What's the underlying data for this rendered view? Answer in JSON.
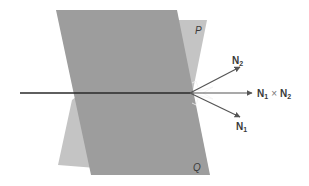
{
  "diagram": {
    "type": "intersecting-planes-normal-vectors",
    "planes": [
      {
        "name": "P",
        "label": "P",
        "color": "#c4c4c4"
      },
      {
        "name": "Q",
        "label": "Q",
        "color": "#9d9d9d"
      }
    ],
    "vectors": [
      {
        "name": "N2",
        "base": "N",
        "sub": "2"
      },
      {
        "name": "N1",
        "base": "N",
        "sub": "1"
      },
      {
        "name": "cross",
        "left": {
          "base": "N",
          "sub": "1"
        },
        "op": "×",
        "right": {
          "base": "N",
          "sub": "2"
        }
      }
    ],
    "colors": {
      "line": "#2a2a2a",
      "arrow": "#555555",
      "background": "#ffffff"
    }
  }
}
